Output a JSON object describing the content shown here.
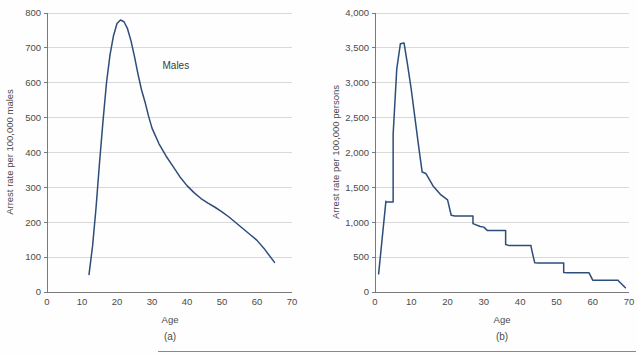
{
  "figure": {
    "background_color": "#fefefe",
    "line_color": "#2d4d7a",
    "grid_color": "#c9c9c9",
    "axis_color": "#6b6b6b",
    "text_color": "#4a4a4a",
    "bottom_rule": true
  },
  "panels": [
    {
      "id": "a",
      "caption": "(a)",
      "annotation": "Males"
    },
    {
      "id": "b",
      "caption": "(b)",
      "annotation": ""
    }
  ],
  "chart_data": [
    {
      "type": "line",
      "title": "",
      "panel": "(a)",
      "xlabel": "Age",
      "ylabel": "Arrest rate per 100,000 males",
      "xlim": [
        0,
        70
      ],
      "ylim": [
        0,
        800
      ],
      "xticks": [
        0,
        10,
        20,
        30,
        40,
        50,
        60,
        70
      ],
      "xtick_labels": [
        "0",
        "10",
        "20",
        "30",
        "40",
        "50",
        "60",
        "70"
      ],
      "yticks": [
        0,
        100,
        200,
        300,
        400,
        500,
        600,
        700,
        800
      ],
      "ytick_labels": [
        "0",
        "100",
        "200",
        "300",
        "400",
        "500",
        "600",
        "700",
        "800"
      ],
      "grid": "horizontal",
      "legend": "none",
      "annotations": [
        {
          "text": "Males",
          "x": 33,
          "y": 640
        }
      ],
      "series": [
        {
          "name": "Males",
          "color": "#2d4d7a",
          "x": [
            12,
            13,
            14,
            15,
            16,
            17,
            18,
            19,
            20,
            21,
            22,
            23,
            24,
            25,
            26,
            27,
            28,
            29,
            30,
            32,
            34,
            36,
            38,
            40,
            42,
            44,
            46,
            48,
            50,
            52,
            55,
            58,
            60,
            62,
            65
          ],
          "y": [
            50,
            130,
            240,
            370,
            490,
            600,
            680,
            735,
            770,
            780,
            775,
            755,
            720,
            675,
            625,
            580,
            545,
            505,
            470,
            425,
            390,
            360,
            330,
            305,
            285,
            268,
            255,
            243,
            230,
            215,
            190,
            165,
            148,
            125,
            85
          ]
        }
      ]
    },
    {
      "type": "line",
      "title": "",
      "panel": "(b)",
      "xlabel": "Age",
      "ylabel": "Arrest rate per 100,000 persons",
      "xlim": [
        0,
        70
      ],
      "ylim": [
        0,
        4000
      ],
      "xticks": [
        0,
        10,
        20,
        30,
        40,
        50,
        60,
        70
      ],
      "xtick_labels": [
        "0",
        "10",
        "20",
        "30",
        "40",
        "50",
        "60",
        "70"
      ],
      "yticks": [
        0,
        500,
        1000,
        1500,
        2000,
        2500,
        3000,
        3500,
        4000
      ],
      "ytick_labels": [
        "0",
        "500",
        "1,000",
        "1,500",
        "2,000",
        "2,500",
        "3,000",
        "3,500",
        "4,000"
      ],
      "grid": "horizontal",
      "legend": "none",
      "annotations": [],
      "series": [
        {
          "name": "Persons",
          "color": "#2d4d7a",
          "x": [
            1,
            3,
            3,
            5,
            5,
            6,
            7,
            8,
            9,
            10,
            11,
            12,
            13,
            14,
            16,
            18,
            20,
            21,
            22,
            22,
            27,
            27,
            29,
            30,
            31,
            31,
            36,
            36,
            37,
            43,
            43,
            44,
            45,
            45,
            48,
            52,
            52,
            53,
            59,
            59,
            60,
            60,
            67,
            67,
            69
          ],
          "y": [
            260,
            1300,
            1290,
            1290,
            2260,
            3200,
            3560,
            3570,
            3250,
            2900,
            2500,
            2100,
            1720,
            1700,
            1520,
            1400,
            1320,
            1100,
            1090,
            1090,
            1090,
            980,
            940,
            930,
            880,
            880,
            880,
            680,
            665,
            665,
            650,
            420,
            415,
            415,
            415,
            415,
            280,
            275,
            275,
            275,
            170,
            170,
            170,
            165,
            60
          ]
        }
      ]
    }
  ]
}
